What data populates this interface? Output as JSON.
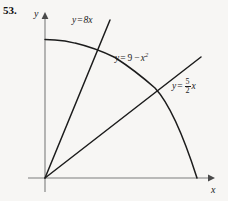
{
  "figure": {
    "problem_number": "53.",
    "axes": {
      "x_label": "x",
      "y_label": "y",
      "origin_px": [
        45,
        178
      ],
      "x_axis_from_px": [
        28,
        178
      ],
      "x_axis_to_px": [
        215,
        178
      ],
      "y_axis_from_px": [
        45,
        192
      ],
      "y_axis_to_px": [
        45,
        12
      ]
    },
    "curves": [
      {
        "name": "line-8x",
        "label": "y = 8x",
        "type": "line",
        "slope": 8,
        "intercept": 0,
        "color": "#1c1c1c"
      },
      {
        "name": "parabola",
        "label": "y = 9 - x2",
        "label_lhs": "y",
        "label_op": "=",
        "label_const": "9",
        "label_minus": "−",
        "label_var": "x",
        "label_exp": "2",
        "type": "parabola",
        "vertex": [
          0,
          9
        ],
        "x_intercept": 3,
        "color": "#1c1c1c"
      },
      {
        "name": "line-5over2x",
        "label": "y = 5/2 x",
        "label_lhs": "y",
        "label_op": "=",
        "numerator": "5",
        "denominator": "2",
        "label_var": "x",
        "type": "line",
        "slope": 2.5,
        "intercept": 0,
        "color": "#1c1c1c"
      }
    ],
    "colors": {
      "background": "#f7f6f4",
      "axis": "#7d7d7d",
      "curve": "#1c1c1c",
      "text": "#1c1c1c"
    }
  }
}
